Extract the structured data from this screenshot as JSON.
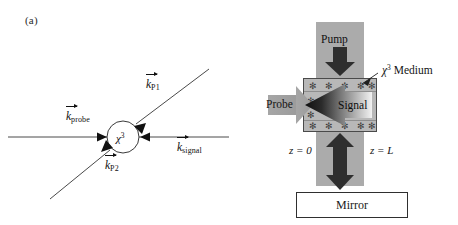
{
  "figure": {
    "background_color": "#ffffff",
    "panels": [
      {
        "id": "a",
        "label": "(a)"
      },
      {
        "id": "b",
        "label": "(b)"
      }
    ]
  },
  "panel_a": {
    "label": "(a)",
    "description": "Wave-vector diagram: probe and signal counter-propagate horizontally, two pump beams P1 and P2 arrive along a diagonal, all meeting at a chi-3 nonlinear interaction region.",
    "medium_symbol": {
      "base": "χ",
      "superscript": "3"
    },
    "vectors": [
      {
        "name": "k-probe",
        "symbol": "k",
        "subscript": "probe",
        "direction": "right",
        "label_x": 66,
        "label_y": 117
      },
      {
        "name": "k-P1",
        "symbol": "k",
        "subscript": "P1",
        "direction": "down-left",
        "label_x": 146,
        "label_y": 84
      },
      {
        "name": "k-P2",
        "symbol": "k",
        "subscript": "P2",
        "direction": "up-right",
        "label_x": 105,
        "label_y": 163
      },
      {
        "name": "k-signal",
        "symbol": "k",
        "subscript": "signal",
        "direction": "left",
        "label_x": 177,
        "label_y": 145
      }
    ]
  },
  "panel_b": {
    "label": "(b)",
    "description": "Geometry of phase conjugation with a mirror: a vertical pump beam passes through the chi-3 medium, a probe enters from the left, the conjugate signal is emitted back to the left, and a mirror at the bottom retro-reflects the pump.",
    "pump_label": "Pump",
    "probe_label": "Probe",
    "signal_label": "Signal",
    "mirror_label": "Mirror",
    "medium_label": {
      "chi": "χ",
      "superscript": "3",
      "text": "Medium"
    },
    "z_start_label": "z = 0",
    "z_end_label": "z = L",
    "grating_marker": "✻",
    "colors": {
      "beam_gray": "#ababab",
      "medium_gray": "#b8b8b8",
      "arrow_dark": "#2e2e2e",
      "probe_arrow_gray": "#9a9a9a",
      "mirror_fill": "#ffffff",
      "stroke": "#2f2f2f"
    }
  }
}
